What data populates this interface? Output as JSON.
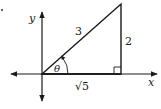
{
  "diagram": {
    "type": "right-triangle-on-axes",
    "axes": {
      "x_label": "x",
      "y_label": "y"
    },
    "triangle": {
      "hypotenuse_label": "3",
      "opposite_label": "2",
      "adjacent_label": "√5",
      "angle_label": "θ",
      "right_angle_marker": true
    },
    "colors": {
      "stroke": "#1a1a1a",
      "background": "#ffffff"
    }
  }
}
